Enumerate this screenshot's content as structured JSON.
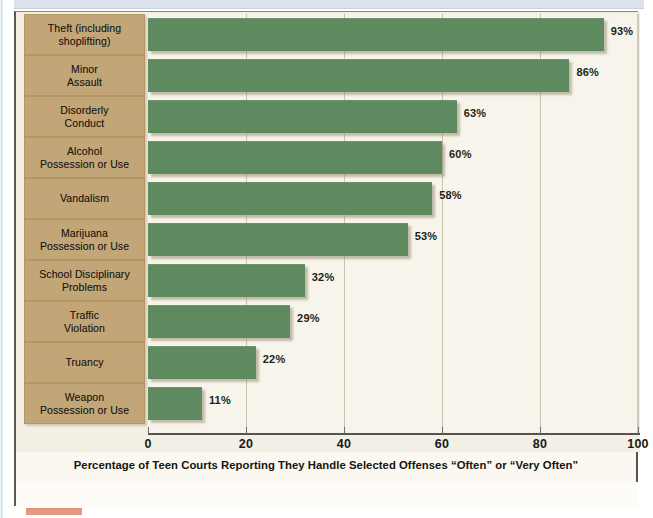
{
  "chart_data": {
    "type": "bar",
    "orientation": "horizontal",
    "title": "",
    "xlabel": "Percentage of Teen Courts Reporting They Handle Selected Offenses “Often” or “Very Often”",
    "ylabel": "",
    "xlim": [
      0,
      100
    ],
    "xticks": [
      0,
      20,
      40,
      60,
      80,
      100
    ],
    "xtick_labels": [
      "0",
      "20",
      "40",
      "60",
      "80",
      "100"
    ],
    "grid": true,
    "grid_axis": "x",
    "legend": "none",
    "value_suffix": "%",
    "categories": [
      "Theft (including shoplifting)",
      "Minor Assault",
      "Disorderly Conduct",
      "Alcohol Possession or Use",
      "Vandalism",
      "Marijuana Possession or Use",
      "School Disciplinary Problems",
      "Traffic Violation",
      "Truancy",
      "Weapon Possession or Use"
    ],
    "values": [
      93,
      86,
      63,
      60,
      58,
      53,
      32,
      29,
      22,
      11
    ],
    "value_labels": [
      "93%",
      "86%",
      "63%",
      "60%",
      "58%",
      "53%",
      "32%",
      "29%",
      "22%",
      "11%"
    ],
    "bars": [
      {
        "label_line1": "Theft (including",
        "label_line2": "shoplifting)",
        "value": 93,
        "value_label": "93%"
      },
      {
        "label_line1": "Minor",
        "label_line2": "Assault",
        "value": 86,
        "value_label": "86%"
      },
      {
        "label_line1": "Disorderly",
        "label_line2": "Conduct",
        "value": 63,
        "value_label": "63%"
      },
      {
        "label_line1": "Alcohol",
        "label_line2": "Possession or Use",
        "value": 60,
        "value_label": "60%"
      },
      {
        "label_line1": "Vandalism",
        "label_line2": "",
        "value": 58,
        "value_label": "58%"
      },
      {
        "label_line1": "Marijuana",
        "label_line2": "Possession or Use",
        "value": 53,
        "value_label": "53%"
      },
      {
        "label_line1": "School Disciplinary",
        "label_line2": "Problems",
        "value": 32,
        "value_label": "32%"
      },
      {
        "label_line1": "Traffic",
        "label_line2": "Violation",
        "value": 29,
        "value_label": "29%"
      },
      {
        "label_line1": "Truancy",
        "label_line2": "",
        "value": 22,
        "value_label": "22%"
      },
      {
        "label_line1": "Weapon",
        "label_line2": "Possession or Use",
        "value": 11,
        "value_label": "11%"
      }
    ],
    "colors": {
      "bar_fill": "#5f8a60",
      "label_box_fill": "#c3a677",
      "plot_background": "#f7f4ec",
      "page_background": "#f3efe4",
      "axis": "#55534f",
      "gridline": "#c9c2ad",
      "text": "#1a1813",
      "top_banner": "#dde3ec",
      "accent_marker": "#e09a80"
    }
  }
}
